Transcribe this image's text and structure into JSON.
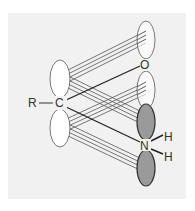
{
  "diagram": {
    "atoms": {
      "r": "R",
      "c": "C",
      "o": "O",
      "n": "N",
      "h1": "H",
      "h2": "H"
    },
    "colors": {
      "background": "#f1f1f1",
      "orbital_fill": "#ffffff",
      "orbital_shaded": "#9a9a9a",
      "stroke": "#444444",
      "text": "#333333"
    },
    "orbitals": [
      {
        "id": "c-upper",
        "cx": 60,
        "cy": 79,
        "rx": 10,
        "ry": 19,
        "shaded": false
      },
      {
        "id": "c-lower",
        "cx": 60,
        "cy": 128,
        "rx": 10,
        "ry": 19,
        "shaded": false
      },
      {
        "id": "o-upper",
        "cx": 146,
        "cy": 40,
        "rx": 9,
        "ry": 19,
        "shaded": false
      },
      {
        "id": "o-lower",
        "cx": 146,
        "cy": 90,
        "rx": 9,
        "ry": 19,
        "shaded": false
      },
      {
        "id": "n-upper",
        "cx": 146,
        "cy": 122,
        "rx": 9,
        "ry": 18,
        "shaded": true
      },
      {
        "id": "n-lower",
        "cx": 146,
        "cy": 168,
        "rx": 9,
        "ry": 18,
        "shaded": true
      }
    ]
  }
}
